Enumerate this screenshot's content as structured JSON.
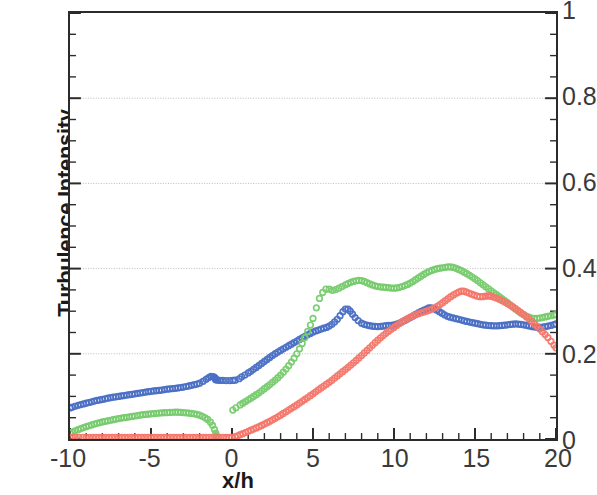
{
  "chart_data": {
    "type": "scatter",
    "title": "",
    "xlabel": "x/h",
    "ylabel": "Turbulence Intensity",
    "xlim": [
      -10,
      20
    ],
    "ylim": [
      0,
      1
    ],
    "xticks": [
      "-10",
      "-5",
      "0",
      "5",
      "10",
      "15",
      "20"
    ],
    "xtick_values": [
      -10,
      -5,
      0,
      5,
      10,
      15,
      20
    ],
    "yticks": [
      "0",
      "0.2",
      "0.4",
      "0.6",
      "0.8",
      "1"
    ],
    "ytick_values": [
      0,
      0.2,
      0.4,
      0.6,
      0.8,
      1
    ],
    "x_minor_tick_step": 1,
    "y_minor_tick_step": 0.05,
    "grid": "horizontal-major-only",
    "y_axis_side": "right",
    "legend": "none",
    "marker": "open-circle",
    "series": [
      {
        "name": "blue-series",
        "color": "#4A6FC4",
        "x": [
          -10.0,
          -9.5,
          -9.0,
          -8.5,
          -8.0,
          -7.5,
          -7.0,
          -6.5,
          -6.0,
          -5.5,
          -5.0,
          -4.5,
          -4.0,
          -3.5,
          -3.0,
          -2.5,
          -2.0,
          -1.6,
          -1.3,
          -1.1,
          -1.0,
          -0.9,
          0.2,
          0.6,
          1.0,
          1.5,
          2.0,
          2.5,
          3.0,
          3.5,
          4.0,
          4.5,
          5.0,
          5.5,
          6.0,
          6.5,
          7.0,
          7.3,
          7.6,
          8.0,
          8.5,
          9.0,
          9.5,
          10.0,
          10.5,
          11.0,
          11.5,
          12.0,
          12.3,
          12.8,
          13.3,
          14.0,
          14.5,
          15.0,
          15.5,
          16.0,
          16.5,
          17.0,
          17.5,
          18.0,
          18.5,
          19.0,
          19.5,
          20.0
        ],
        "y": [
          0.073,
          0.079,
          0.084,
          0.089,
          0.093,
          0.097,
          0.1,
          0.103,
          0.106,
          0.109,
          0.112,
          0.114,
          0.117,
          0.119,
          0.122,
          0.126,
          0.131,
          0.14,
          0.147,
          0.145,
          0.141,
          0.138,
          0.138,
          0.146,
          0.155,
          0.168,
          0.182,
          0.196,
          0.208,
          0.219,
          0.23,
          0.241,
          0.251,
          0.258,
          0.265,
          0.281,
          0.305,
          0.3,
          0.285,
          0.272,
          0.266,
          0.264,
          0.266,
          0.268,
          0.275,
          0.285,
          0.296,
          0.305,
          0.308,
          0.299,
          0.288,
          0.281,
          0.276,
          0.272,
          0.268,
          0.266,
          0.266,
          0.268,
          0.27,
          0.268,
          0.264,
          0.262,
          0.265,
          0.27
        ]
      },
      {
        "name": "green-series",
        "color": "#77CB6E",
        "x": [
          -10.0,
          -9.5,
          -9.0,
          -8.5,
          -8.0,
          -7.5,
          -7.0,
          -6.5,
          -6.0,
          -5.5,
          -5.0,
          -4.5,
          -4.0,
          -3.5,
          -3.0,
          -2.5,
          -2.0,
          -1.5,
          -1.2,
          -1.0,
          -0.95,
          0.05,
          0.5,
          1.0,
          1.5,
          2.0,
          2.5,
          3.0,
          3.5,
          4.0,
          4.5,
          5.0,
          5.4,
          5.8,
          6.2,
          6.6,
          7.0,
          7.5,
          8.0,
          8.5,
          9.0,
          9.5,
          10.0,
          10.5,
          11.0,
          11.5,
          12.0,
          12.5,
          13.0,
          13.5,
          14.0,
          14.5,
          15.0,
          15.5,
          16.0,
          16.5,
          17.0,
          17.5,
          18.0,
          18.5,
          19.0,
          19.5,
          20.0
        ],
        "y": [
          0.014,
          0.022,
          0.029,
          0.035,
          0.04,
          0.044,
          0.048,
          0.051,
          0.054,
          0.057,
          0.059,
          0.061,
          0.062,
          0.063,
          0.062,
          0.06,
          0.056,
          0.046,
          0.032,
          0.014,
          0.004,
          0.068,
          0.08,
          0.092,
          0.104,
          0.118,
          0.133,
          0.15,
          0.172,
          0.2,
          0.238,
          0.283,
          0.33,
          0.352,
          0.349,
          0.354,
          0.362,
          0.37,
          0.372,
          0.364,
          0.358,
          0.356,
          0.354,
          0.358,
          0.366,
          0.378,
          0.39,
          0.398,
          0.402,
          0.404,
          0.398,
          0.388,
          0.376,
          0.362,
          0.348,
          0.334,
          0.32,
          0.305,
          0.292,
          0.284,
          0.284,
          0.288,
          0.292
        ]
      },
      {
        "name": "red-series",
        "color": "#F4766A",
        "x": [
          -10.0,
          -9.0,
          -8.0,
          -7.0,
          -6.0,
          -5.0,
          -4.0,
          -3.0,
          -2.0,
          -1.0,
          0.0,
          0.5,
          1.0,
          1.5,
          2.0,
          2.5,
          3.0,
          3.5,
          4.0,
          4.5,
          5.0,
          5.5,
          6.0,
          6.5,
          7.0,
          7.5,
          8.0,
          8.5,
          9.0,
          9.5,
          10.0,
          10.5,
          11.0,
          11.5,
          12.0,
          12.5,
          13.0,
          13.5,
          14.0,
          14.3,
          14.8,
          15.3,
          15.8,
          16.0,
          16.5,
          17.0,
          17.5,
          18.0,
          18.5,
          19.0,
          19.5,
          20.0
        ],
        "y": [
          0.004,
          0.004,
          0.004,
          0.004,
          0.004,
          0.004,
          0.004,
          0.004,
          0.004,
          0.004,
          0.004,
          0.01,
          0.018,
          0.026,
          0.035,
          0.045,
          0.056,
          0.068,
          0.08,
          0.093,
          0.106,
          0.12,
          0.133,
          0.148,
          0.163,
          0.179,
          0.196,
          0.214,
          0.232,
          0.248,
          0.262,
          0.275,
          0.286,
          0.294,
          0.3,
          0.308,
          0.32,
          0.334,
          0.345,
          0.347,
          0.34,
          0.334,
          0.336,
          0.335,
          0.328,
          0.318,
          0.306,
          0.292,
          0.276,
          0.258,
          0.238,
          0.214
        ]
      }
    ]
  }
}
